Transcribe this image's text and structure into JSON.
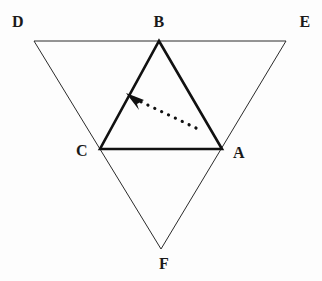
{
  "figure": {
    "background_color": "#fdfdfd",
    "stroke_color": "#1a1a1a",
    "width": 322,
    "height": 281
  },
  "outer_triangle": {
    "name": "DEF",
    "stroke_width": 1,
    "stroke_color": "#2b2b2b",
    "fill": "none",
    "points": "34,41 286,41 161,249"
  },
  "inner_triangle": {
    "name": "ABC",
    "stroke_width": 2.6,
    "stroke_color": "#111111",
    "fill": "none",
    "points": "159,41 222,149 100,149"
  },
  "arrow": {
    "name": "dotted-arrow",
    "direction": "up-left",
    "stroke_color": "#111111",
    "stroke_width": 3.2,
    "dash_pattern": "0.1 7.5",
    "tail_x": 196,
    "tail_y": 128,
    "head_x": 131,
    "head_y": 97,
    "head_polygon": "126,93 144,100 137,104 139,110"
  },
  "labels": [
    {
      "id": "D",
      "text": "D",
      "x": 18,
      "y": 22
    },
    {
      "id": "B",
      "text": "B",
      "x": 159,
      "y": 22
    },
    {
      "id": "E",
      "text": "E",
      "x": 305,
      "y": 22
    },
    {
      "id": "C",
      "text": "C",
      "x": 82,
      "y": 151
    },
    {
      "id": "A",
      "text": "A",
      "x": 239,
      "y": 153
    },
    {
      "id": "F",
      "text": "F",
      "x": 164,
      "y": 264
    }
  ]
}
